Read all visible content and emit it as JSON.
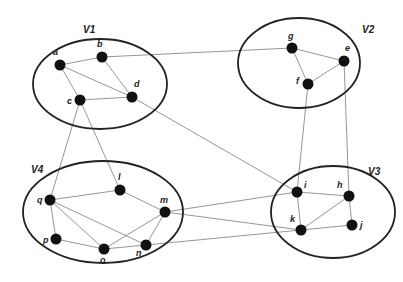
{
  "colors": {
    "background": "#ffffff",
    "cluster_stroke": "#222222",
    "edge": "#8a8a8a",
    "node": "#111111"
  },
  "clusters": [
    {
      "id": "V1",
      "label": "V1",
      "cx": 100,
      "cy": 84,
      "rx": 67,
      "ry": 45,
      "label_x": 83,
      "label_y": 33
    },
    {
      "id": "V2",
      "label": "V2",
      "cx": 299,
      "cy": 63,
      "rx": 61,
      "ry": 45,
      "label_x": 362,
      "label_y": 33
    },
    {
      "id": "V3",
      "label": "V3",
      "cx": 333,
      "cy": 212,
      "rx": 62,
      "ry": 46,
      "label_x": 368,
      "label_y": 175
    },
    {
      "id": "V4",
      "label": "V4",
      "cx": 103,
      "cy": 212,
      "rx": 80,
      "ry": 51,
      "label_x": 31,
      "label_y": 173
    }
  ],
  "nodes": [
    {
      "id": "a",
      "label": "a",
      "x": 60,
      "y": 65,
      "lx": 53,
      "ly": 55
    },
    {
      "id": "b",
      "label": "b",
      "x": 102,
      "y": 57,
      "lx": 97,
      "ly": 47
    },
    {
      "id": "c",
      "label": "c",
      "x": 80,
      "y": 100,
      "lx": 67,
      "ly": 104
    },
    {
      "id": "d",
      "label": "d",
      "x": 132,
      "y": 97,
      "lx": 134,
      "ly": 87
    },
    {
      "id": "g",
      "label": "g",
      "x": 292,
      "y": 48,
      "lx": 288,
      "ly": 39
    },
    {
      "id": "e",
      "label": "e",
      "x": 344,
      "y": 61,
      "lx": 345,
      "ly": 51
    },
    {
      "id": "f",
      "label": "f",
      "x": 308,
      "y": 84,
      "lx": 296,
      "ly": 84
    },
    {
      "id": "i",
      "label": "i",
      "x": 297,
      "y": 192,
      "lx": 304,
      "ly": 188
    },
    {
      "id": "h",
      "label": "h",
      "x": 349,
      "y": 196,
      "lx": 337,
      "ly": 188
    },
    {
      "id": "k",
      "label": "k",
      "x": 301,
      "y": 230,
      "lx": 290,
      "ly": 222
    },
    {
      "id": "j",
      "label": "j",
      "x": 352,
      "y": 225,
      "lx": 360,
      "ly": 228
    },
    {
      "id": "l",
      "label": "l",
      "x": 120,
      "y": 190,
      "lx": 118,
      "ly": 180
    },
    {
      "id": "q",
      "label": "q",
      "x": 50,
      "y": 200,
      "lx": 37,
      "ly": 203
    },
    {
      "id": "m",
      "label": "m",
      "x": 165,
      "y": 212,
      "lx": 160,
      "ly": 203
    },
    {
      "id": "p",
      "label": "p",
      "x": 56,
      "y": 239,
      "lx": 43,
      "ly": 243
    },
    {
      "id": "o",
      "label": "o",
      "x": 104,
      "y": 249,
      "lx": 100,
      "ly": 263
    },
    {
      "id": "n",
      "label": "n",
      "x": 146,
      "y": 245,
      "lx": 136,
      "ly": 256
    }
  ],
  "edges": [
    [
      "a",
      "b"
    ],
    [
      "a",
      "c"
    ],
    [
      "a",
      "d"
    ],
    [
      "b",
      "d"
    ],
    [
      "c",
      "d"
    ],
    [
      "b",
      "g"
    ],
    [
      "d",
      "i"
    ],
    [
      "c",
      "q"
    ],
    [
      "c",
      "l"
    ],
    [
      "g",
      "e"
    ],
    [
      "g",
      "f"
    ],
    [
      "f",
      "e"
    ],
    [
      "f",
      "i"
    ],
    [
      "e",
      "h"
    ],
    [
      "i",
      "h"
    ],
    [
      "i",
      "k"
    ],
    [
      "h",
      "k"
    ],
    [
      "h",
      "j"
    ],
    [
      "k",
      "j"
    ],
    [
      "q",
      "l"
    ],
    [
      "l",
      "m"
    ],
    [
      "q",
      "p"
    ],
    [
      "q",
      "o"
    ],
    [
      "q",
      "n"
    ],
    [
      "p",
      "o"
    ],
    [
      "o",
      "n"
    ],
    [
      "o",
      "m"
    ],
    [
      "m",
      "n"
    ],
    [
      "m",
      "i"
    ],
    [
      "m",
      "k"
    ],
    [
      "n",
      "k"
    ]
  ]
}
